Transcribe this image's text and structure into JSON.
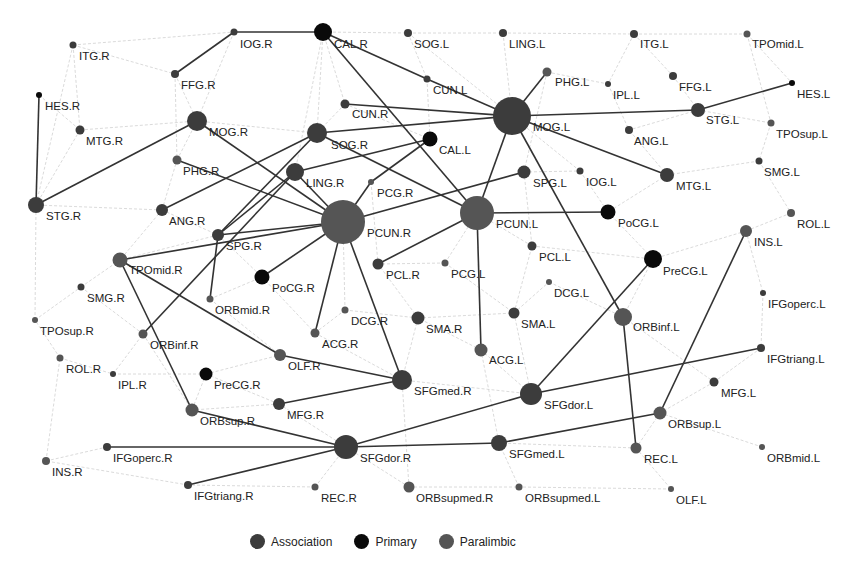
{
  "colors": {
    "association": "#3c3c3c",
    "primary": "#0a0a0a",
    "paralimbic": "#555555",
    "weak_edge": "#d0d0d0",
    "strong_edge": "#333333"
  },
  "legend": [
    {
      "label": "Association",
      "category": "association"
    },
    {
      "label": "Primary",
      "category": "primary"
    },
    {
      "label": "Paralimbic",
      "category": "paralimbic"
    }
  ],
  "nodes": [
    {
      "id": "IOG.R",
      "x": 234,
      "y": 32,
      "r": 3.5,
      "cat": "association",
      "lx": 240,
      "ly": 48
    },
    {
      "id": "CAL.R",
      "x": 323,
      "y": 32,
      "r": 9,
      "cat": "primary",
      "lx": 334,
      "ly": 48
    },
    {
      "id": "SOG.L",
      "x": 408,
      "y": 33,
      "r": 4,
      "cat": "association",
      "lx": 414,
      "ly": 48
    },
    {
      "id": "LING.L",
      "x": 503,
      "y": 33,
      "r": 4,
      "cat": "association",
      "lx": 509,
      "ly": 48
    },
    {
      "id": "ITG.L",
      "x": 634,
      "y": 34,
      "r": 4,
      "cat": "association",
      "lx": 640,
      "ly": 48
    },
    {
      "id": "TPOmid.L",
      "x": 747,
      "y": 34,
      "r": 3.5,
      "cat": "paralimbic",
      "lx": 752,
      "ly": 48
    },
    {
      "id": "ITG.R",
      "x": 73,
      "y": 45,
      "r": 3.5,
      "cat": "association",
      "lx": 79,
      "ly": 60
    },
    {
      "id": "FFG.R",
      "x": 175,
      "y": 74,
      "r": 4,
      "cat": "association",
      "lx": 181,
      "ly": 89
    },
    {
      "id": "CUN.L",
      "x": 427,
      "y": 79,
      "r": 3.5,
      "cat": "association",
      "lx": 433,
      "ly": 94
    },
    {
      "id": "PHG.L",
      "x": 547,
      "y": 72,
      "r": 4.5,
      "cat": "paralimbic",
      "lx": 555,
      "ly": 86
    },
    {
      "id": "IPL.L",
      "x": 608,
      "y": 84,
      "r": 3,
      "cat": "association",
      "lx": 613,
      "ly": 99
    },
    {
      "id": "FFG.L",
      "x": 673,
      "y": 76,
      "r": 4,
      "cat": "association",
      "lx": 679,
      "ly": 91
    },
    {
      "id": "HES.L",
      "x": 792,
      "y": 83,
      "r": 3,
      "cat": "primary",
      "lx": 797,
      "ly": 98
    },
    {
      "id": "HES.R",
      "x": 39,
      "y": 95,
      "r": 3,
      "cat": "primary",
      "lx": 45,
      "ly": 110
    },
    {
      "id": "CUN.R",
      "x": 345,
      "y": 104,
      "r": 4.5,
      "cat": "association",
      "lx": 352,
      "ly": 118
    },
    {
      "id": "MOG.L",
      "x": 512,
      "y": 116,
      "r": 19,
      "cat": "association",
      "lx": 533,
      "ly": 131
    },
    {
      "id": "STG.L",
      "x": 698,
      "y": 110,
      "r": 7,
      "cat": "association",
      "lx": 706,
      "ly": 124
    },
    {
      "id": "MOG.R",
      "x": 197,
      "y": 121,
      "r": 10,
      "cat": "association",
      "lx": 209,
      "ly": 136
    },
    {
      "id": "MTG.R",
      "x": 80,
      "y": 130,
      "r": 4.5,
      "cat": "association",
      "lx": 86,
      "ly": 145
    },
    {
      "id": "ANG.L",
      "x": 629,
      "y": 130,
      "r": 4,
      "cat": "association",
      "lx": 634,
      "ly": 145
    },
    {
      "id": "TPOsup.L",
      "x": 771,
      "y": 123,
      "r": 3.5,
      "cat": "paralimbic",
      "lx": 776,
      "ly": 138
    },
    {
      "id": "SOG.R",
      "x": 317,
      "y": 133,
      "r": 10,
      "cat": "association",
      "lx": 331,
      "ly": 149
    },
    {
      "id": "CAL.L",
      "x": 430,
      "y": 139,
      "r": 7.5,
      "cat": "primary",
      "lx": 439,
      "ly": 154
    },
    {
      "id": "PHG.R",
      "x": 177,
      "y": 160,
      "r": 4.5,
      "cat": "paralimbic",
      "lx": 183,
      "ly": 175
    },
    {
      "id": "LING.R",
      "x": 295,
      "y": 172,
      "r": 9,
      "cat": "association",
      "lx": 306,
      "ly": 187
    },
    {
      "id": "PCG.R",
      "x": 371,
      "y": 182,
      "r": 3,
      "cat": "paralimbic",
      "lx": 377,
      "ly": 197
    },
    {
      "id": "SPG.L",
      "x": 524,
      "y": 172,
      "r": 6.5,
      "cat": "association",
      "lx": 533,
      "ly": 187
    },
    {
      "id": "IOG.L",
      "x": 580,
      "y": 171,
      "r": 3.5,
      "cat": "association",
      "lx": 586,
      "ly": 186
    },
    {
      "id": "MTG.L",
      "x": 667,
      "y": 175,
      "r": 7,
      "cat": "association",
      "lx": 676,
      "ly": 190
    },
    {
      "id": "SMG.L",
      "x": 759,
      "y": 161,
      "r": 3.5,
      "cat": "association",
      "lx": 764,
      "ly": 176
    },
    {
      "id": "STG.R",
      "x": 36,
      "y": 205,
      "r": 8,
      "cat": "association",
      "lx": 46,
      "ly": 220
    },
    {
      "id": "ANG.R",
      "x": 162,
      "y": 210,
      "r": 6,
      "cat": "association",
      "lx": 169,
      "ly": 225
    },
    {
      "id": "PCUN.R",
      "x": 343,
      "y": 222,
      "r": 22,
      "cat": "paralimbic",
      "lx": 367,
      "ly": 237
    },
    {
      "id": "PCUN.L",
      "x": 477,
      "y": 213,
      "r": 17,
      "cat": "paralimbic",
      "lx": 496,
      "ly": 228
    },
    {
      "id": "PoCG.L",
      "x": 608,
      "y": 212,
      "r": 7.5,
      "cat": "primary",
      "lx": 618,
      "ly": 227
    },
    {
      "id": "ROL.L",
      "x": 791,
      "y": 213,
      "r": 4,
      "cat": "paralimbic",
      "lx": 797,
      "ly": 228
    },
    {
      "id": "INS.L",
      "x": 746,
      "y": 231,
      "r": 6,
      "cat": "paralimbic",
      "lx": 754,
      "ly": 246
    },
    {
      "id": "SPG.R",
      "x": 218,
      "y": 235,
      "r": 6,
      "cat": "association",
      "lx": 226,
      "ly": 250
    },
    {
      "id": "TPOmid.R",
      "x": 120,
      "y": 260,
      "r": 7.5,
      "cat": "paralimbic",
      "lx": 129,
      "ly": 274
    },
    {
      "id": "PCL.R",
      "x": 378,
      "y": 264,
      "r": 5.5,
      "cat": "association",
      "lx": 386,
      "ly": 279
    },
    {
      "id": "PCG.L",
      "x": 445,
      "y": 263,
      "r": 3.5,
      "cat": "paralimbic",
      "lx": 451,
      "ly": 278
    },
    {
      "id": "PCL.L",
      "x": 532,
      "y": 246,
      "r": 4.5,
      "cat": "association",
      "lx": 539,
      "ly": 261
    },
    {
      "id": "PreCG.L",
      "x": 653,
      "y": 259,
      "r": 9,
      "cat": "primary",
      "lx": 663,
      "ly": 275
    },
    {
      "id": "PoCG.R",
      "x": 262,
      "y": 277,
      "r": 7.5,
      "cat": "primary",
      "lx": 272,
      "ly": 292
    },
    {
      "id": "SMG.R",
      "x": 81,
      "y": 287,
      "r": 3.5,
      "cat": "association",
      "lx": 87,
      "ly": 302
    },
    {
      "id": "DCG.L",
      "x": 549,
      "y": 282,
      "r": 3,
      "cat": "paralimbic",
      "lx": 554,
      "ly": 297
    },
    {
      "id": "ORBmid.R",
      "x": 210,
      "y": 299,
      "r": 3.5,
      "cat": "paralimbic",
      "lx": 215,
      "ly": 314
    },
    {
      "id": "IFGoperc.L",
      "x": 763,
      "y": 293,
      "r": 3,
      "cat": "association",
      "lx": 768,
      "ly": 308
    },
    {
      "id": "TPOsup.R",
      "x": 35,
      "y": 320,
      "r": 3,
      "cat": "paralimbic",
      "lx": 40,
      "ly": 335
    },
    {
      "id": "DCG.R",
      "x": 345,
      "y": 310,
      "r": 3.5,
      "cat": "paralimbic",
      "lx": 351,
      "ly": 325
    },
    {
      "id": "SMA.R",
      "x": 418,
      "y": 318,
      "r": 6.5,
      "cat": "association",
      "lx": 426,
      "ly": 333
    },
    {
      "id": "SMA.L",
      "x": 514,
      "y": 313,
      "r": 5.5,
      "cat": "association",
      "lx": 521,
      "ly": 328
    },
    {
      "id": "ORBinf.L",
      "x": 623,
      "y": 317,
      "r": 9,
      "cat": "paralimbic",
      "lx": 633,
      "ly": 331
    },
    {
      "id": "ORBinf.R",
      "x": 143,
      "y": 334,
      "r": 4.5,
      "cat": "paralimbic",
      "lx": 150,
      "ly": 349
    },
    {
      "id": "ACG.R",
      "x": 315,
      "y": 333,
      "r": 4.5,
      "cat": "paralimbic",
      "lx": 322,
      "ly": 348
    },
    {
      "id": "ACG.L",
      "x": 481,
      "y": 350,
      "r": 6.5,
      "cat": "paralimbic",
      "lx": 489,
      "ly": 364
    },
    {
      "id": "ROL.R",
      "x": 60,
      "y": 358,
      "r": 3.5,
      "cat": "paralimbic",
      "lx": 66,
      "ly": 373
    },
    {
      "id": "IPL.R",
      "x": 113,
      "y": 374,
      "r": 3,
      "cat": "association",
      "lx": 118,
      "ly": 389
    },
    {
      "id": "OLF.R",
      "x": 280,
      "y": 355,
      "r": 6,
      "cat": "paralimbic",
      "lx": 288,
      "ly": 370
    },
    {
      "id": "IFGtriang.L",
      "x": 761,
      "y": 348,
      "r": 4,
      "cat": "association",
      "lx": 767,
      "ly": 363
    },
    {
      "id": "PreCG.R",
      "x": 206,
      "y": 374,
      "r": 6.5,
      "cat": "primary",
      "lx": 214,
      "ly": 389
    },
    {
      "id": "SFGmed.R",
      "x": 402,
      "y": 380,
      "r": 10,
      "cat": "association",
      "lx": 414,
      "ly": 395
    },
    {
      "id": "MFG.L",
      "x": 714,
      "y": 382,
      "r": 4.5,
      "cat": "association",
      "lx": 721,
      "ly": 397
    },
    {
      "id": "SFGdor.L",
      "x": 531,
      "y": 394,
      "r": 11,
      "cat": "association",
      "lx": 544,
      "ly": 409
    },
    {
      "id": "ORBsup.R",
      "x": 192,
      "y": 410,
      "r": 6.5,
      "cat": "paralimbic",
      "lx": 200,
      "ly": 425
    },
    {
      "id": "MFG.R",
      "x": 279,
      "y": 404,
      "r": 6,
      "cat": "association",
      "lx": 287,
      "ly": 419
    },
    {
      "id": "ORBsup.L",
      "x": 660,
      "y": 413,
      "r": 6.5,
      "cat": "paralimbic",
      "lx": 668,
      "ly": 428
    },
    {
      "id": "IFGoperc.R",
      "x": 107,
      "y": 447,
      "r": 4,
      "cat": "association",
      "lx": 113,
      "ly": 462
    },
    {
      "id": "SFGdor.R",
      "x": 346,
      "y": 447,
      "r": 12,
      "cat": "association",
      "lx": 360,
      "ly": 462
    },
    {
      "id": "SFGmed.L",
      "x": 499,
      "y": 443,
      "r": 8,
      "cat": "association",
      "lx": 509,
      "ly": 458
    },
    {
      "id": "REC.L",
      "x": 636,
      "y": 448,
      "r": 5.5,
      "cat": "paralimbic",
      "lx": 644,
      "ly": 463
    },
    {
      "id": "ORBmid.L",
      "x": 762,
      "y": 447,
      "r": 3,
      "cat": "paralimbic",
      "lx": 767,
      "ly": 462
    },
    {
      "id": "INS.R",
      "x": 46,
      "y": 461,
      "r": 4,
      "cat": "paralimbic",
      "lx": 52,
      "ly": 476
    },
    {
      "id": "IFGtriang.R",
      "x": 188,
      "y": 485,
      "r": 4,
      "cat": "association",
      "lx": 194,
      "ly": 500
    },
    {
      "id": "REC.R",
      "x": 315,
      "y": 487,
      "r": 3.5,
      "cat": "paralimbic",
      "lx": 321,
      "ly": 502
    },
    {
      "id": "ORBsupmed.R",
      "x": 409,
      "y": 487,
      "r": 5.5,
      "cat": "paralimbic",
      "lx": 416,
      "ly": 502
    },
    {
      "id": "ORBsupmed.L",
      "x": 519,
      "y": 487,
      "r": 3.5,
      "cat": "paralimbic",
      "lx": 525,
      "ly": 502
    },
    {
      "id": "OLF.L",
      "x": 671,
      "y": 489,
      "r": 3,
      "cat": "paralimbic",
      "lx": 676,
      "ly": 504
    }
  ],
  "strong_edges": [
    [
      "IOG.R",
      "CAL.R"
    ],
    [
      "FFG.R",
      "IOG.R"
    ],
    [
      "HES.R",
      "STG.R"
    ],
    [
      "STG.R",
      "MOG.R"
    ],
    [
      "CAL.R",
      "CUN.L"
    ],
    [
      "CAL.R",
      "PCUN.L"
    ],
    [
      "CUN.L",
      "MOG.L"
    ],
    [
      "CUN.R",
      "MOG.L"
    ],
    [
      "SOG.R",
      "MOG.L"
    ],
    [
      "MOG.L",
      "PHG.L"
    ],
    [
      "MOG.L",
      "STG.L"
    ],
    [
      "STG.L",
      "HES.L"
    ],
    [
      "MOG.L",
      "MTG.L"
    ],
    [
      "MOG.L",
      "PCUN.L"
    ],
    [
      "MOG.L",
      "ORBinf.L"
    ],
    [
      "MOG.R",
      "PCUN.R"
    ],
    [
      "PHG.R",
      "PCUN.R"
    ],
    [
      "ANG.R",
      "SOG.R"
    ],
    [
      "SPG.R",
      "SOG.R"
    ],
    [
      "SPG.R",
      "LING.R"
    ],
    [
      "SPG.R",
      "PCUN.R"
    ],
    [
      "LING.R",
      "CAL.L"
    ],
    [
      "LING.R",
      "PCUN.R"
    ],
    [
      "CAL.L",
      "PCG.R"
    ],
    [
      "SOG.R",
      "PCUN.L"
    ],
    [
      "PCUN.R",
      "PCG.R"
    ],
    [
      "PCUN.R",
      "SPG.L"
    ],
    [
      "PCUN.L",
      "PoCG.L"
    ],
    [
      "PCUN.L",
      "PCL.R"
    ],
    [
      "PCUN.L",
      "ACG.L"
    ],
    [
      "PCUN.R",
      "PoCG.R"
    ],
    [
      "PCUN.R",
      "ACG.R"
    ],
    [
      "PCUN.R",
      "SFGmed.R"
    ],
    [
      "PCUN.R",
      "TPOmid.R"
    ],
    [
      "SPG.R",
      "ORBmid.R"
    ],
    [
      "LING.R",
      "ORBinf.R"
    ],
    [
      "TPOmid.R",
      "OLF.R"
    ],
    [
      "TPOmid.R",
      "ORBsup.R"
    ],
    [
      "OLF.R",
      "SFGmed.R"
    ],
    [
      "MFG.R",
      "SFGmed.R"
    ],
    [
      "ORBsup.R",
      "SFGdor.R"
    ],
    [
      "IFGoperc.R",
      "SFGdor.R"
    ],
    [
      "IFGtriang.R",
      "SFGdor.R"
    ],
    [
      "SFGdor.R",
      "SFGdor.L"
    ],
    [
      "SFGdor.R",
      "SFGmed.L"
    ],
    [
      "SFGdor.L",
      "PreCG.L"
    ],
    [
      "SFGdor.L",
      "IFGtriang.L"
    ],
    [
      "SFGmed.L",
      "ORBsup.L"
    ],
    [
      "ORBsup.L",
      "INS.L"
    ],
    [
      "ORBinf.L",
      "REC.L"
    ]
  ],
  "weak_edges": [
    [
      "ITG.R",
      "IOG.R"
    ],
    [
      "ITG.R",
      "FFG.R"
    ],
    [
      "ITG.R",
      "MTG.R"
    ],
    [
      "ITG.R",
      "STG.R"
    ],
    [
      "HES.R",
      "MTG.R"
    ],
    [
      "MTG.R",
      "MOG.R"
    ],
    [
      "MTG.R",
      "STG.R"
    ],
    [
      "FFG.R",
      "MOG.R"
    ],
    [
      "FFG.R",
      "PHG.R"
    ],
    [
      "IOG.R",
      "MOG.R"
    ],
    [
      "CAL.R",
      "SOG.L"
    ],
    [
      "CAL.R",
      "CUN.R"
    ],
    [
      "CAL.R",
      "SOG.R"
    ],
    [
      "CAL.R",
      "LING.R"
    ],
    [
      "SOG.L",
      "LING.L"
    ],
    [
      "SOG.L",
      "CUN.L"
    ],
    [
      "SOG.L",
      "MOG.L"
    ],
    [
      "LING.L",
      "MOG.L"
    ],
    [
      "LING.L",
      "ITG.L"
    ],
    [
      "ITG.L",
      "TPOmid.L"
    ],
    [
      "ITG.L",
      "FFG.L"
    ],
    [
      "ITG.L",
      "IPL.L"
    ],
    [
      "FFG.L",
      "STG.L"
    ],
    [
      "TPOmid.L",
      "TPOsup.L"
    ],
    [
      "TPOmid.L",
      "HES.L"
    ],
    [
      "STG.L",
      "TPOsup.L"
    ],
    [
      "STG.L",
      "ANG.L"
    ],
    [
      "TPOsup.L",
      "SMG.L"
    ],
    [
      "SMG.L",
      "MTG.L"
    ],
    [
      "SMG.L",
      "ROL.L"
    ],
    [
      "MTG.L",
      "PoCG.L"
    ],
    [
      "MTG.L",
      "ANG.L"
    ],
    [
      "IOG.L",
      "MOG.L"
    ],
    [
      "IOG.L",
      "PoCG.L"
    ],
    [
      "ROL.L",
      "INS.L"
    ],
    [
      "INS.L",
      "PreCG.L"
    ],
    [
      "INS.L",
      "IFGoperc.L"
    ],
    [
      "IFGoperc.L",
      "IFGtriang.L"
    ],
    [
      "IFGtriang.L",
      "MFG.L"
    ],
    [
      "MFG.L",
      "ORBsup.L"
    ],
    [
      "ORBsup.L",
      "ORBmid.L"
    ],
    [
      "ORBsup.L",
      "REC.L"
    ],
    [
      "REC.L",
      "OLF.L"
    ],
    [
      "REC.L",
      "SFGmed.L"
    ],
    [
      "OLF.L",
      "ORBsupmed.L"
    ],
    [
      "ORBsupmed.L",
      "SFGmed.L"
    ],
    [
      "ORBsupmed.R",
      "ORBsupmed.L"
    ],
    [
      "ORBsupmed.R",
      "SFGdor.R"
    ],
    [
      "ORBsupmed.R",
      "SFGmed.R"
    ],
    [
      "REC.R",
      "SFGdor.R"
    ],
    [
      "REC.R",
      "IFGtriang.R"
    ],
    [
      "IFGtriang.R",
      "INS.R"
    ],
    [
      "INS.R",
      "IFGoperc.R"
    ],
    [
      "INS.R",
      "ROL.R"
    ],
    [
      "ROL.R",
      "TPOsup.R"
    ],
    [
      "ROL.R",
      "IPL.R"
    ],
    [
      "TPOsup.R",
      "SMG.R"
    ],
    [
      "TPOsup.R",
      "STG.R"
    ],
    [
      "SMG.R",
      "TPOmid.R"
    ],
    [
      "SMG.R",
      "ORBinf.R"
    ],
    [
      "IPL.R",
      "PreCG.R"
    ],
    [
      "IPL.R",
      "ORBinf.R"
    ],
    [
      "PreCG.R",
      "ORBsup.R"
    ],
    [
      "PreCG.R",
      "MFG.R"
    ],
    [
      "PreCG.R",
      "OLF.R"
    ],
    [
      "ORBinf.R",
      "ORBsup.R"
    ],
    [
      "ORBmid.R",
      "OLF.R"
    ],
    [
      "ORBmid.R",
      "PoCG.R"
    ],
    [
      "PoCG.R",
      "ACG.R"
    ],
    [
      "ACG.R",
      "DCG.R"
    ],
    [
      "DCG.R",
      "PCUN.R"
    ],
    [
      "DCG.R",
      "SMA.R"
    ],
    [
      "SMA.R",
      "PCL.R"
    ],
    [
      "SMA.R",
      "SFGmed.R"
    ],
    [
      "SMA.R",
      "SMA.L"
    ],
    [
      "SMA.L",
      "PCL.L"
    ],
    [
      "SMA.L",
      "DCG.L"
    ],
    [
      "SMA.L",
      "SFGdor.L"
    ],
    [
      "PCL.L",
      "PCUN.L"
    ],
    [
      "PCL.L",
      "PreCG.L"
    ],
    [
      "DCG.L",
      "ORBinf.L"
    ],
    [
      "PCG.L",
      "PCUN.L"
    ],
    [
      "PCG.L",
      "PCL.R"
    ],
    [
      "PCG.L",
      "SMA.L"
    ],
    [
      "ACG.L",
      "SFGdor.L"
    ],
    [
      "ACG.L",
      "SFGmed.L"
    ],
    [
      "ACG.L",
      "SMA.R"
    ],
    [
      "ACG.R",
      "SFGmed.R"
    ],
    [
      "SFGmed.R",
      "SFGdor.L"
    ],
    [
      "MFG.R",
      "SFGdor.R"
    ],
    [
      "MFG.R",
      "ORBsup.R"
    ],
    [
      "ORBinf.L",
      "PreCG.L"
    ],
    [
      "ORBinf.L",
      "MFG.L"
    ],
    [
      "PoCG.L",
      "PreCG.L"
    ],
    [
      "SPG.L",
      "IOG.L"
    ],
    [
      "SPG.L",
      "PCL.L"
    ],
    [
      "ANG.R",
      "SPG.R"
    ],
    [
      "ANG.R",
      "PHG.R"
    ],
    [
      "ANG.R",
      "STG.R"
    ],
    [
      "ANG.R",
      "TPOmid.R"
    ],
    [
      "PHG.R",
      "MOG.R"
    ],
    [
      "MOG.R",
      "SOG.R"
    ],
    [
      "CUN.R",
      "SOG.R"
    ],
    [
      "CUN.L",
      "CAL.L"
    ],
    [
      "CUN.R",
      "CAL.L"
    ],
    [
      "IPL.L",
      "ANG.L"
    ],
    [
      "PHG.L",
      "IPL.L"
    ],
    [
      "PHG.L",
      "SPG.L"
    ],
    [
      "PCG.R",
      "PCL.R"
    ],
    [
      "SPG.R",
      "TPOmid.R"
    ],
    [
      "SPG.R",
      "PoCG.R"
    ]
  ]
}
